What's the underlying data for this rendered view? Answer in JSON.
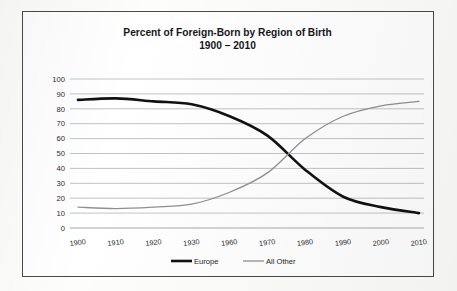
{
  "chart_data": {
    "type": "line",
    "title": "Percent of Foreign-Born by Region of Birth",
    "subtitle": "1900 – 2010",
    "xlabel": "",
    "ylabel": "",
    "ylim": [
      0,
      100
    ],
    "ytick_step": 10,
    "yticks": [
      0,
      10,
      20,
      30,
      40,
      50,
      60,
      70,
      80,
      90,
      100
    ],
    "grid": true,
    "legend_position": "bottom",
    "categories": [
      "1900",
      "1910",
      "1920",
      "1930",
      "1960",
      "1970",
      "1980",
      "1990",
      "2000",
      "2010"
    ],
    "series": [
      {
        "name": "Europe",
        "color": "#111114",
        "width": 2.6,
        "values": [
          86,
          87,
          85,
          83,
          75,
          62,
          39,
          21,
          14,
          10
        ]
      },
      {
        "name": "All Other",
        "color": "#8d9094",
        "width": 1.3,
        "values": [
          14,
          13,
          14,
          16,
          24,
          37,
          60,
          75,
          82,
          85
        ]
      }
    ]
  },
  "legend": {
    "items": [
      {
        "label": "Europe"
      },
      {
        "label": "All Other"
      }
    ]
  }
}
